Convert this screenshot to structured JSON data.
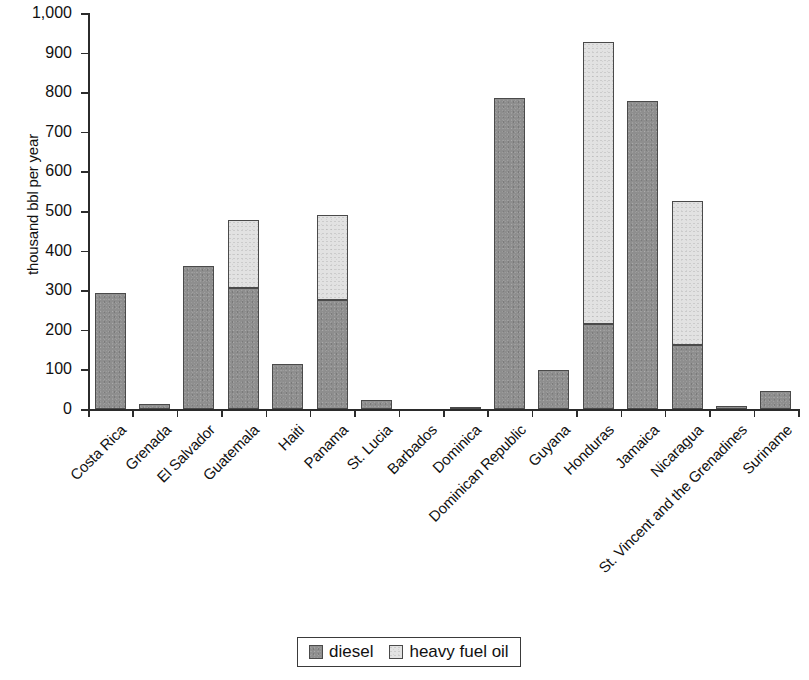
{
  "chart_data": {
    "type": "bar",
    "subtype": "stacked-vertical",
    "title": "",
    "subtitle": "",
    "xlabel": "",
    "ylabel": "thousand bbl per year",
    "ylim": [
      0,
      1000
    ],
    "ytick_step": 100,
    "ytick_labels": [
      "1,000",
      "900",
      "800",
      "700",
      "600",
      "500",
      "400",
      "300",
      "200",
      "100",
      "0"
    ],
    "ytick_values": [
      1000,
      900,
      800,
      700,
      600,
      500,
      400,
      300,
      200,
      100,
      0
    ],
    "grid": false,
    "legend_position": "bottom-center",
    "categories": [
      "Costa Rica",
      "Grenada",
      "El Salvador",
      "Guatemala",
      "Haiti",
      "Panama",
      "St. Lucia",
      "Barbados",
      "Dominica",
      "Dominican Republic",
      "Guyana",
      "Honduras",
      "Jamaica",
      "Nicaragua",
      "St. Vincent and the Grenadines",
      "Suriname"
    ],
    "series": [
      {
        "name": "diesel",
        "color": "#8e8e8e",
        "values": [
          292,
          12,
          360,
          305,
          114,
          275,
          22,
          0,
          4,
          785,
          98,
          215,
          778,
          162,
          8,
          45
        ]
      },
      {
        "name": "heavy fuel oil",
        "color": "#e2e2e2",
        "values": [
          0,
          0,
          0,
          172,
          0,
          215,
          0,
          0,
          0,
          0,
          0,
          713,
          0,
          363,
          0,
          0
        ]
      }
    ],
    "totals": [
      292,
      12,
      360,
      477,
      114,
      490,
      22,
      0,
      4,
      785,
      98,
      928,
      778,
      525,
      8,
      45
    ]
  },
  "legend": {
    "items": [
      {
        "label": "diesel",
        "color": "#8e8e8e"
      },
      {
        "label": "heavy fuel oil",
        "color": "#e2e2e2"
      }
    ]
  }
}
